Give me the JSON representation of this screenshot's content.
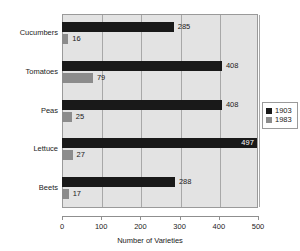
{
  "chart_data": {
    "type": "bar",
    "orientation": "horizontal",
    "title": "",
    "xlabel": "Number of Varieties",
    "ylabel": "",
    "categories": [
      "Cucumbers",
      "Tomatoes",
      "Peas",
      "Lettuce",
      "Beets"
    ],
    "series": [
      {
        "name": "1903",
        "color": "#191919",
        "values": [
          285,
          408,
          408,
          497,
          288
        ]
      },
      {
        "name": "1983",
        "color": "#8c8c8c",
        "values": [
          16,
          79,
          25,
          27,
          17
        ]
      }
    ],
    "xlim": [
      0,
      500
    ],
    "xticks": [
      0,
      100,
      200,
      300,
      400,
      500
    ],
    "xtick_labels": [
      "0",
      "100",
      "200",
      "300",
      "400",
      "500"
    ],
    "grid": true,
    "grid_axis": "x",
    "legend_position": "right",
    "data_labels": true,
    "plot_background": "#e3e3e3",
    "figure_background": "#ffffff"
  }
}
